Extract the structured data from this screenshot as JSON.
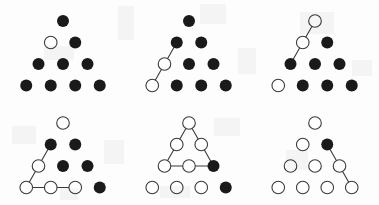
{
  "figure": {
    "panel_count": 6,
    "columns": 3,
    "rows": 2,
    "colors": {
      "filled_dot": "#1a1a1a",
      "open_dot_fill": "#ffffff",
      "open_dot_stroke": "#3a3a3a",
      "line": "#3a3a3a",
      "background": "#fdfdfd"
    },
    "geometry": {
      "dot_diameter": 12,
      "column_spacing": 24.5,
      "row_spacing": 21.5,
      "panel_width": 126,
      "panel_height": 102
    }
  },
  "chart_data": {
    "type": "diagram",
    "row_sizes": [
      1,
      2,
      3,
      4
    ],
    "state_legend": {
      "filled": "solid black dot",
      "open": "white dot with outline"
    },
    "panels": [
      {
        "id": "panel-1",
        "index": 1,
        "position": {
          "col": 1,
          "row": 1
        },
        "states": [
          [
            "filled"
          ],
          [
            "open",
            "filled"
          ],
          [
            "filled",
            "filled",
            "filled"
          ],
          [
            "filled",
            "filled",
            "filled",
            "filled"
          ]
        ],
        "open_count": 1,
        "filled_count": 9,
        "lines": []
      },
      {
        "id": "panel-2",
        "index": 2,
        "position": {
          "col": 2,
          "row": 1
        },
        "states": [
          [
            "filled"
          ],
          [
            "filled",
            "filled"
          ],
          [
            "open",
            "filled",
            "filled"
          ],
          [
            "open",
            "filled",
            "filled",
            "filled"
          ]
        ],
        "open_count": 2,
        "filled_count": 8,
        "lines": [
          {
            "from": [
              1,
              0
            ],
            "to": [
              2,
              0
            ]
          },
          {
            "from": [
              2,
              0
            ],
            "to": [
              3,
              0
            ]
          }
        ]
      },
      {
        "id": "panel-3",
        "index": 3,
        "position": {
          "col": 3,
          "row": 1
        },
        "states": [
          [
            "open"
          ],
          [
            "open",
            "filled"
          ],
          [
            "filled",
            "filled",
            "filled"
          ],
          [
            "open",
            "filled",
            "filled",
            "filled"
          ]
        ],
        "open_count": 3,
        "filled_count": 7,
        "lines": [
          {
            "from": [
              0,
              0
            ],
            "to": [
              1,
              0
            ]
          },
          {
            "from": [
              1,
              0
            ],
            "to": [
              2,
              0
            ]
          }
        ]
      },
      {
        "id": "panel-4",
        "index": 4,
        "position": {
          "col": 1,
          "row": 2
        },
        "states": [
          [
            "open"
          ],
          [
            "filled",
            "filled"
          ],
          [
            "open",
            "filled",
            "filled"
          ],
          [
            "open",
            "open",
            "open",
            "filled"
          ]
        ],
        "open_count": 5,
        "filled_count": 5,
        "lines": [
          {
            "from": [
              1,
              0
            ],
            "to": [
              2,
              0
            ]
          },
          {
            "from": [
              2,
              0
            ],
            "to": [
              3,
              0
            ]
          },
          {
            "from": [
              3,
              0
            ],
            "to": [
              3,
              2
            ]
          }
        ]
      },
      {
        "id": "panel-5",
        "index": 5,
        "position": {
          "col": 2,
          "row": 2
        },
        "states": [
          [
            "open"
          ],
          [
            "open",
            "open"
          ],
          [
            "open",
            "open",
            "filled"
          ],
          [
            "open",
            "open",
            "open",
            "filled"
          ]
        ],
        "open_count": 8,
        "filled_count": 2,
        "lines": [
          {
            "from": [
              0,
              0
            ],
            "to": [
              2,
              0
            ]
          },
          {
            "from": [
              0,
              0
            ],
            "to": [
              2,
              2
            ]
          },
          {
            "from": [
              2,
              0
            ],
            "to": [
              2,
              2
            ]
          }
        ]
      },
      {
        "id": "panel-6",
        "index": 6,
        "position": {
          "col": 3,
          "row": 2
        },
        "states": [
          [
            "open"
          ],
          [
            "open",
            "filled"
          ],
          [
            "open",
            "open",
            "open"
          ],
          [
            "open",
            "open",
            "open",
            "open"
          ]
        ],
        "open_count": 9,
        "filled_count": 1,
        "lines": [
          {
            "from": [
              1,
              1
            ],
            "to": [
              2,
              2
            ]
          },
          {
            "from": [
              2,
              2
            ],
            "to": [
              3,
              3
            ]
          }
        ]
      }
    ]
  }
}
